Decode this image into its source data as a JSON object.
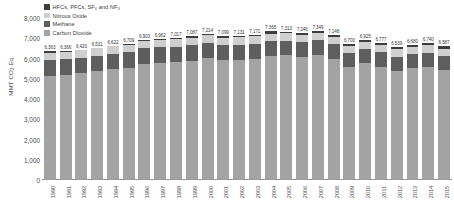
{
  "chart_data": {
    "type": "bar",
    "stacked": true,
    "title": "",
    "xlabel": "",
    "ylabel": "MMT CO2 Eq.",
    "ylim": [
      0,
      8000
    ],
    "yticks": [
      "8,000",
      "7,000",
      "6,000",
      "5,000",
      "4,000",
      "3,000",
      "2,000",
      "1,000",
      "0"
    ],
    "ytick_values": [
      8000,
      7000,
      6000,
      5000,
      4000,
      3000,
      2000,
      1000,
      0
    ],
    "grid": false,
    "legend_position": "top-left",
    "categories": [
      "1990",
      "1991",
      "1992",
      "1993",
      "1994",
      "1995",
      "1996",
      "1997",
      "1998",
      "1999",
      "2000",
      "2001",
      "2002",
      "2003",
      "2004",
      "2005",
      "2006",
      "2007",
      "2008",
      "2009",
      "2010",
      "2011",
      "2012",
      "2013",
      "2014",
      "2015"
    ],
    "totals": [
      6363,
      6366,
      6420,
      6531,
      6622,
      6709,
      6903,
      6962,
      7017,
      7087,
      7214,
      7099,
      7131,
      7171,
      7365,
      7313,
      7246,
      7349,
      7148,
      6700,
      6925,
      6777,
      6539,
      6680,
      6740,
      6587
    ],
    "total_labels": [
      "6,363",
      "6,366",
      "6,420",
      "6,531",
      "6,622",
      "6,709",
      "6,903",
      "6,962",
      "7,017",
      "7,087",
      "7,214",
      "7,099",
      "7,131",
      "7,171",
      "7,365",
      "7,313",
      "7,246",
      "7,349",
      "7,148",
      "6,700",
      "6,925",
      "6,777",
      "6,539",
      "6,680",
      "6,740",
      "6,587"
    ],
    "series": [
      {
        "name": "Carbon Dioxide",
        "color": "#a3a3a3",
        "values": [
          5122,
          5180,
          5249,
          5358,
          5447,
          5520,
          5713,
          5772,
          5810,
          5884,
          6019,
          5900,
          5939,
          5985,
          6133,
          6158,
          6086,
          6183,
          5978,
          5553,
          5746,
          5589,
          5362,
          5508,
          5566,
          5411
        ]
      },
      {
        "name": "Methane",
        "color": "#5e5e5e",
        "values": [
          780,
          778,
          778,
          773,
          776,
          778,
          775,
          771,
          765,
          760,
          746,
          738,
          732,
          726,
          722,
          711,
          719,
          716,
          717,
          712,
          707,
          702,
          695,
          697,
          695,
          690
        ]
      },
      {
        "name": "Nitrous Oxide",
        "color": "#cfcfcf",
        "values": [
          369,
          369,
          370,
          371,
          375,
          381,
          380,
          380,
          383,
          380,
          380,
          377,
          373,
          372,
          375,
          372,
          372,
          374,
          370,
          359,
          378,
          383,
          381,
          376,
          380,
          383
        ]
      },
      {
        "name": "HFCs, PFCs, SF6 and NF3",
        "color": "#3d3d3d",
        "values": [
          92,
          39,
          23,
          29,
          24,
          30,
          35,
          39,
          59,
          63,
          69,
          84,
          87,
          88,
          135,
          72,
          69,
          76,
          83,
          76,
          94,
          103,
          101,
          99,
          99,
          103
        ]
      }
    ]
  },
  "legend": {
    "items": [
      {
        "label": "HFCs, PFCs, SF₆ and NF₃",
        "color": "#3d3d3d",
        "key": "hfc"
      },
      {
        "label": "Nitrous Oxide",
        "color": "#cfcfcf",
        "key": "n2o"
      },
      {
        "label": "Methane",
        "color": "#5e5e5e",
        "key": "ch4"
      },
      {
        "label": "Carbon Dioxide",
        "color": "#a3a3a3",
        "key": "co2"
      }
    ]
  },
  "axis": {
    "y_title": "MMT CO₂ Eq."
  }
}
